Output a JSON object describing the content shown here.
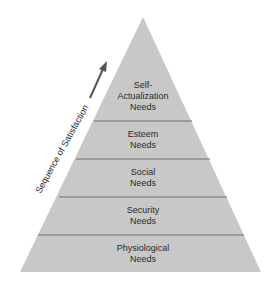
{
  "diagram": {
    "type": "pyramid",
    "side_label": "Sequence of Satisfaction",
    "arrow": "up-right",
    "colors": {
      "fill": "#c8c8c8",
      "divider": "#6e6e6e",
      "arrow": "#555555",
      "text": "#2a2a2a"
    },
    "levels": [
      {
        "line1": "Self-",
        "line2": "Actualization",
        "line3": "Needs"
      },
      {
        "line1": "Esteem",
        "line2": "Needs"
      },
      {
        "line1": "Social",
        "line2": "Needs"
      },
      {
        "line1": "Security",
        "line2": "Needs"
      },
      {
        "line1": "Physiological",
        "line2": "Needs"
      }
    ]
  }
}
